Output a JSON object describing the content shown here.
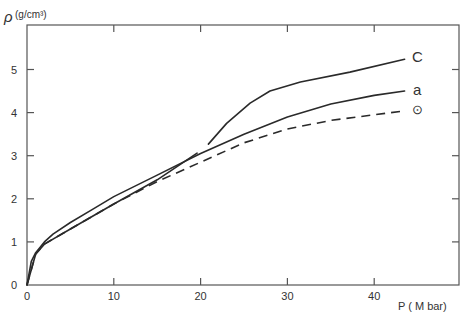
{
  "chart_data": {
    "type": "line",
    "title": "",
    "xlabel": "P (M bar)",
    "ylabel": "ρ (g/cm³)",
    "xlim": [
      0,
      50
    ],
    "ylim": [
      0,
      6
    ],
    "x_ticks": [
      "0",
      "10",
      "20",
      "30",
      "40"
    ],
    "y_ticks": [
      "0",
      "1",
      "2",
      "3",
      "4",
      "5"
    ],
    "grid": false,
    "legend": "inline labels at curve ends",
    "series": [
      {
        "name": "c",
        "style": "solid",
        "segments": [
          {
            "x": [
              0,
              1,
              2,
              5,
              10,
              15,
              19.6
            ],
            "y": [
              0,
              0.72,
              0.95,
              1.3,
              1.88,
              2.44,
              3.06
            ]
          },
          {
            "x": [
              20.9,
              23,
              25.7,
              28,
              31.5,
              37.2,
              43.5
            ],
            "y": [
              3.27,
              3.75,
              4.22,
              4.5,
              4.71,
              4.94,
              5.24
            ]
          }
        ]
      },
      {
        "name": "a",
        "style": "solid",
        "x": [
          0,
          0.5,
          1,
          2,
          3,
          5,
          7.5,
          10,
          15,
          20,
          25,
          30,
          35,
          40,
          43.5
        ],
        "y": [
          0,
          0.55,
          0.75,
          1.0,
          1.18,
          1.45,
          1.75,
          2.05,
          2.55,
          3.05,
          3.5,
          3.9,
          4.2,
          4.4,
          4.5
        ]
      },
      {
        "name": "⊙",
        "style": "dashed",
        "x": [
          0,
          1,
          2,
          5,
          10,
          15,
          20,
          25,
          30,
          35,
          40,
          43.5
        ],
        "y": [
          0,
          0.72,
          0.95,
          1.3,
          1.88,
          2.4,
          2.85,
          3.3,
          3.62,
          3.82,
          3.95,
          4.04
        ]
      }
    ]
  },
  "labels": {
    "y_axis_symbol": "ρ",
    "y_axis_unit": "(g/cm³)",
    "x_axis": "P ( M bar)",
    "curve_c": "C",
    "curve_a": "a",
    "curve_sun": "⊙"
  }
}
